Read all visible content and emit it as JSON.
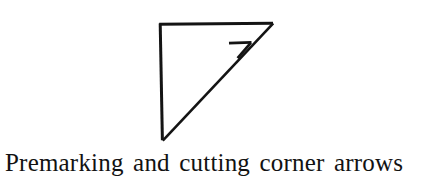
{
  "page": {
    "width": 429,
    "height": 184,
    "background_color": "#ffffff"
  },
  "figure": {
    "name": "corner-arrow-diagram",
    "ink_color": "#141414",
    "stroke_width": 2.6,
    "shapes": {
      "triangle": {
        "type": "right-triangle",
        "right_angle_corner": "top-left",
        "vertices": [
          [
            160,
            24
          ],
          [
            273,
            24
          ],
          [
            162,
            140
          ]
        ],
        "edges": [
          {
            "name": "top-edge",
            "from": [
              160,
              24
            ],
            "to": [
              273,
              24
            ],
            "orientation": "horizontal"
          },
          {
            "name": "left-edge",
            "from": [
              160,
              24
            ],
            "to": [
              162,
              140
            ],
            "orientation": "vertical"
          },
          {
            "name": "hypotenuse",
            "from": [
              162,
              140
            ],
            "to": [
              273,
              24
            ],
            "orientation": "diagonal"
          }
        ]
      },
      "arrow_barb": {
        "type": "open-arrowhead",
        "points_toward": "top-right apex",
        "sits_on": "hypotenuse",
        "strokes": [
          {
            "name": "barb-horizontal",
            "from": [
              229,
              43
            ],
            "to": [
              251,
              43
            ]
          },
          {
            "name": "barb-angled",
            "from": [
              251,
              43
            ],
            "to": [
              238,
              58
            ]
          }
        ]
      }
    }
  },
  "caption": {
    "text": "Premarking and cutting corner arrows",
    "color": "#121212"
  }
}
